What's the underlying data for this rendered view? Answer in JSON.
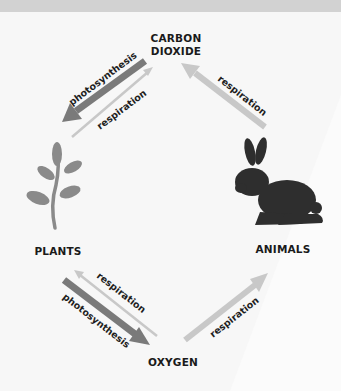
{
  "nodes": {
    "carbon_dioxide": "CARBON\nDIOXIDE",
    "carbon_dioxide_line1": "CARBON",
    "carbon_dioxide_line2": "DIOXIDE",
    "plants": "PLANTS",
    "animals": "ANIMALS",
    "oxygen": "OXYGEN"
  },
  "arrows": [
    {
      "from": "carbon_dioxide",
      "to": "plants",
      "label": "photosynthesis",
      "style": "dark-thick"
    },
    {
      "from": "plants",
      "to": "carbon_dioxide",
      "label": "respiration",
      "style": "light-thin"
    },
    {
      "from": "animals",
      "to": "carbon_dioxide",
      "label": "respiration",
      "style": "light-thick"
    },
    {
      "from": "oxygen",
      "to": "plants",
      "label": "respiration",
      "style": "light-thin"
    },
    {
      "from": "plants",
      "to": "oxygen",
      "label": "photosynthesis",
      "style": "dark-thick"
    },
    {
      "from": "oxygen",
      "to": "animals",
      "label": "respiration",
      "style": "light-thick"
    }
  ],
  "labels": {
    "photosynthesis": "photosynthesis",
    "respiration": "respiration"
  },
  "icons": {
    "plant": "plant-sprig-icon",
    "animal": "rabbit-silhouette-icon"
  },
  "colors": {
    "dark_arrow": "#7a7a7a",
    "light_arrow": "#c8c8c8",
    "plant": "#8a8a8a",
    "rabbit": "#2e2e2e",
    "text": "#1a1a1a",
    "background": "#f7f7f7",
    "topbar": "#d2d2d2"
  }
}
